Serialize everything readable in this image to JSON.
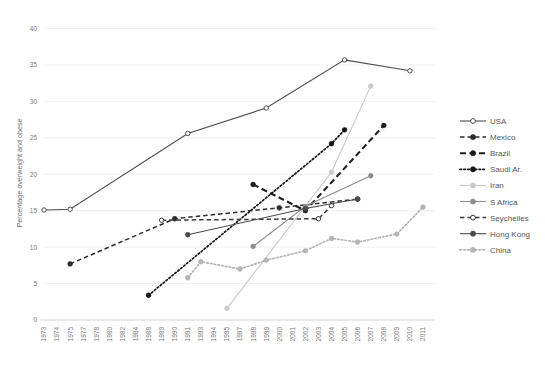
{
  "chart_data": {
    "type": "line",
    "title": "",
    "xlabel": "",
    "ylabel": "Percentage overweight and obese",
    "ylim": [
      0,
      42
    ],
    "yticks": [
      0,
      5,
      10,
      15,
      20,
      25,
      30,
      35,
      40
    ],
    "grid": true,
    "legend_position": "right",
    "x_tick_labels": [
      "1973",
      "1974",
      "1975",
      "1977",
      "1978",
      "1980",
      "1982",
      "1984",
      "1988",
      "1989",
      "1990",
      "1991",
      "1993",
      "1994",
      "1995",
      "1997",
      "1998",
      "1999",
      "2000",
      "2001",
      "2002",
      "2003",
      "2004",
      "2005",
      "2006",
      "2007",
      "2008",
      "2009",
      "2010",
      "2011"
    ],
    "series": [
      {
        "name": "USA",
        "color": "#4d4d4d",
        "marker": "open-circle",
        "dash": "solid",
        "points": [
          {
            "x": 1973,
            "y": 15.1
          },
          {
            "x": 1975,
            "y": 15.2
          },
          {
            "x": 1991,
            "y": 25.6
          },
          {
            "x": 1999,
            "y": 29.1
          },
          {
            "x": 2005,
            "y": 35.7
          },
          {
            "x": 2010,
            "y": 34.2
          }
        ]
      },
      {
        "name": "Mexico",
        "color": "#2b2b2b",
        "marker": "filled-circle",
        "dash": "dashed",
        "points": [
          {
            "x": 1975,
            "y": 7.7
          },
          {
            "x": 1990,
            "y": 13.9
          },
          {
            "x": 2000,
            "y": 15.4
          },
          {
            "x": 2006,
            "y": 16.6
          }
        ]
      },
      {
        "name": "Brazil",
        "color": "#1f1f1f",
        "marker": "filled-circle",
        "dash": "long-dash",
        "points": [
          {
            "x": 1998,
            "y": 18.6
          },
          {
            "x": 2002,
            "y": 15.0
          },
          {
            "x": 2008,
            "y": 26.7
          }
        ]
      },
      {
        "name": "Saudi Ar.",
        "color": "#141414",
        "marker": "filled-circle",
        "dash": "dotted",
        "points": [
          {
            "x": 1988,
            "y": 3.4
          },
          {
            "x": 2004,
            "y": 24.2
          },
          {
            "x": 2005,
            "y": 26.1
          }
        ]
      },
      {
        "name": "Iran",
        "color": "#cacaca",
        "marker": "filled-circle",
        "dash": "solid",
        "points": [
          {
            "x": 1995,
            "y": 1.6
          },
          {
            "x": 2004,
            "y": 20.3
          },
          {
            "x": 2007,
            "y": 32.1
          }
        ]
      },
      {
        "name": "S Africa",
        "color": "#8e8e8e",
        "marker": "filled-circle",
        "dash": "solid",
        "points": [
          {
            "x": 1998,
            "y": 10.1
          },
          {
            "x": 2002,
            "y": 15.6
          },
          {
            "x": 2007,
            "y": 19.8
          }
        ]
      },
      {
        "name": "Seychelles",
        "color": "#3a3a3a",
        "marker": "open-circle",
        "dash": "dashed",
        "points": [
          {
            "x": 1989,
            "y": 13.7
          },
          {
            "x": 2003,
            "y": 13.9
          },
          {
            "x": 2004,
            "y": 15.7
          }
        ]
      },
      {
        "name": "Hong Kong",
        "color": "#4a4a4a",
        "marker": "filled-circle",
        "dash": "solid",
        "points": [
          {
            "x": 1991,
            "y": 11.7
          },
          {
            "x": 2002,
            "y": 15.3
          },
          {
            "x": 2006,
            "y": 16.6
          }
        ]
      },
      {
        "name": "China",
        "color": "#b4b4b4",
        "marker": "filled-circle",
        "dash": "dotted",
        "points": [
          {
            "x": 1991,
            "y": 5.8
          },
          {
            "x": 1993,
            "y": 8.0
          },
          {
            "x": 1997,
            "y": 7.0
          },
          {
            "x": 1999,
            "y": 8.2
          },
          {
            "x": 2002,
            "y": 9.5
          },
          {
            "x": 2004,
            "y": 11.2
          },
          {
            "x": 2006,
            "y": 10.7
          },
          {
            "x": 2009,
            "y": 11.8
          },
          {
            "x": 2011,
            "y": 15.5
          }
        ]
      }
    ]
  },
  "legend": {
    "items": [
      {
        "label": "USA"
      },
      {
        "label": "Mexico"
      },
      {
        "label": "Brazil"
      },
      {
        "label": "Saudi Ar."
      },
      {
        "label": "Iran"
      },
      {
        "label": "S Africa"
      },
      {
        "label": "Seychelles"
      },
      {
        "label": "Hong Kong"
      },
      {
        "label": "China"
      }
    ]
  }
}
